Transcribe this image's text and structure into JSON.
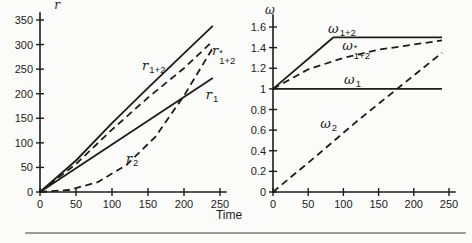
{
  "figure": {
    "time_label": "Time",
    "line_color": "#1c1c1c",
    "divider_color": "#9b9b9b",
    "background": "#fbfbf9"
  },
  "chart_data": [
    {
      "type": "line",
      "panel": "left",
      "title": "",
      "ylabel": "r",
      "xlabel": "Time",
      "xlim": [
        0,
        250
      ],
      "ylim": [
        0,
        350
      ],
      "grid": false,
      "legend": "inline-curve-labels",
      "xticks": [
        "0",
        "50",
        "100",
        "150",
        "200",
        "250"
      ],
      "xtick_values": [
        0,
        50,
        100,
        150,
        200,
        250
      ],
      "yticks": [
        "0",
        "50",
        "100",
        "150",
        "200",
        "250",
        "300",
        "350"
      ],
      "ytick_values": [
        0,
        50,
        100,
        150,
        200,
        250,
        300,
        350
      ],
      "series": [
        {
          "id": "r1plus2",
          "label": {
            "base": "r",
            "sup": "",
            "sub": "1+2"
          },
          "style": "solid",
          "x": [
            0,
            50,
            100,
            150,
            200,
            240
          ],
          "y": [
            0,
            64,
            140,
            212,
            282,
            338
          ],
          "label_x": 158,
          "label_y": 258
        },
        {
          "id": "rstar1plus2",
          "label": {
            "base": "r",
            "sup": "*",
            "sub": "1+2"
          },
          "style": "dashed",
          "x": [
            0,
            50,
            100,
            150,
            200,
            240
          ],
          "y": [
            0,
            57,
            127,
            192,
            252,
            307
          ],
          "label_x": 255,
          "label_y": 280
        },
        {
          "id": "r1",
          "label": {
            "base": "r",
            "sup": "",
            "sub": "1"
          },
          "style": "solid",
          "x": [
            0,
            240
          ],
          "y": [
            0,
            232
          ],
          "label_x": 239,
          "label_y": 199
        },
        {
          "id": "r2",
          "label": {
            "base": "r",
            "sup": "",
            "sub": "2"
          },
          "style": "dashed",
          "x": [
            0,
            40,
            80,
            120,
            160,
            200,
            240
          ],
          "y": [
            0,
            4,
            20,
            55,
            112,
            196,
            293
          ],
          "label_x": 128,
          "label_y": 70
        }
      ]
    },
    {
      "type": "line",
      "panel": "right",
      "title": "",
      "ylabel": "ω",
      "xlabel": "Time",
      "xlim": [
        0,
        250
      ],
      "ylim": [
        0,
        1.6
      ],
      "grid": false,
      "legend": "inline-curve-labels",
      "xticks": [
        "0",
        "50",
        "100",
        "150",
        "200",
        "250"
      ],
      "xtick_values": [
        0,
        50,
        100,
        150,
        200,
        250
      ],
      "yticks": [
        "0",
        "0.2",
        "0.4",
        "0.6",
        "0.8",
        "1",
        "1.2",
        "1.4",
        "1.6"
      ],
      "ytick_values": [
        0,
        0.2,
        0.4,
        0.6,
        0.8,
        1,
        1.2,
        1.4,
        1.6
      ],
      "series": [
        {
          "id": "w1plus2",
          "label": {
            "base": "ω",
            "sup": "",
            "sub": "1+2"
          },
          "style": "solid",
          "x": [
            0,
            86,
            240
          ],
          "y": [
            1.0,
            1.5,
            1.5
          ],
          "label_x": 98,
          "label_y": 1.59
        },
        {
          "id": "wstar1plus2",
          "label": {
            "base": "ω",
            "sup": "*",
            "sub": "1+2"
          },
          "style": "dashed",
          "x": [
            0,
            50,
            100,
            150,
            200,
            240
          ],
          "y": [
            1.0,
            1.19,
            1.3,
            1.38,
            1.43,
            1.47
          ],
          "label_x": 118,
          "label_y": 1.39
        },
        {
          "id": "w1",
          "label": {
            "base": "ω",
            "sup": "",
            "sub": "1"
          },
          "style": "solid",
          "x": [
            0,
            240
          ],
          "y": [
            1.0,
            1.0
          ],
          "label_x": 113,
          "label_y": 1.1
        },
        {
          "id": "w2",
          "label": {
            "base": "ω",
            "sup": "",
            "sub": "2"
          },
          "style": "dashed",
          "x": [
            0,
            60,
            120,
            180,
            240
          ],
          "y": [
            0,
            0.34,
            0.69,
            1.02,
            1.35
          ],
          "label_x": 79,
          "label_y": 0.67
        }
      ]
    }
  ]
}
